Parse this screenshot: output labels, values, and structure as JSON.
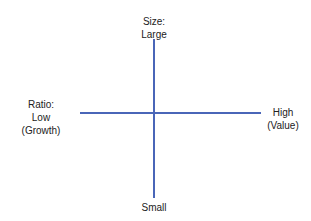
{
  "diagram": {
    "type": "quadrant-axes",
    "axis_color": "#4a66b8",
    "vertical_axis": {
      "name": "Size",
      "top_label": [
        "Size:",
        "Large"
      ],
      "bottom_label": [
        "Small"
      ]
    },
    "horizontal_axis": {
      "name": "Ratio",
      "left_label": [
        "Ratio:",
        "Low",
        "(Growth)"
      ],
      "right_label": [
        "High",
        "(Value)"
      ]
    }
  }
}
